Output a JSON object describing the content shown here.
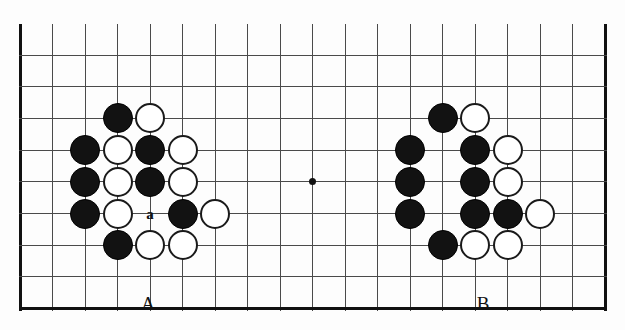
{
  "figure": {
    "type": "go-board-diagram",
    "width": 625,
    "height": 330,
    "background_color": "#fdfdfd",
    "line_color": "#4a4a4a",
    "edge_color": "#111111",
    "black_stone_color": "#121212",
    "white_stone_color": "#ffffff"
  },
  "board": {
    "columns": 19,
    "rows": 9,
    "origin_x": 20,
    "origin_y": 55,
    "col_spacing": 32.5,
    "row_spacing": 31.7,
    "stone_diameter": 30,
    "top_edge_y": 24,
    "vertical_line_top": 24,
    "edges": {
      "left": true,
      "right": true,
      "bottom": true,
      "top": false
    },
    "star_points": [
      {
        "col": 9,
        "row": 4
      }
    ]
  },
  "stones": [
    {
      "color": "black",
      "col": 3,
      "row": 2,
      "group": "A"
    },
    {
      "color": "white",
      "col": 4,
      "row": 2,
      "group": "A"
    },
    {
      "color": "black",
      "col": 2,
      "row": 3,
      "group": "A"
    },
    {
      "color": "white",
      "col": 3,
      "row": 3,
      "group": "A"
    },
    {
      "color": "black",
      "col": 4,
      "row": 3,
      "group": "A"
    },
    {
      "color": "white",
      "col": 5,
      "row": 3,
      "group": "A"
    },
    {
      "color": "black",
      "col": 2,
      "row": 4,
      "group": "A"
    },
    {
      "color": "white",
      "col": 3,
      "row": 4,
      "group": "A"
    },
    {
      "color": "black",
      "col": 4,
      "row": 4,
      "group": "A"
    },
    {
      "color": "white",
      "col": 5,
      "row": 4,
      "group": "A"
    },
    {
      "color": "black",
      "col": 2,
      "row": 5,
      "group": "A"
    },
    {
      "color": "white",
      "col": 3,
      "row": 5,
      "group": "A"
    },
    {
      "color": "black",
      "col": 5,
      "row": 5,
      "group": "A"
    },
    {
      "color": "white",
      "col": 6,
      "row": 5,
      "group": "A"
    },
    {
      "color": "black",
      "col": 3,
      "row": 6,
      "group": "A"
    },
    {
      "color": "white",
      "col": 4,
      "row": 6,
      "group": "A"
    },
    {
      "color": "white",
      "col": 5,
      "row": 6,
      "group": "A"
    },
    {
      "color": "black",
      "col": 13,
      "row": 2,
      "group": "B"
    },
    {
      "color": "white",
      "col": 14,
      "row": 2,
      "group": "B"
    },
    {
      "color": "black",
      "col": 12,
      "row": 3,
      "group": "B"
    },
    {
      "color": "black",
      "col": 14,
      "row": 3,
      "group": "B"
    },
    {
      "color": "white",
      "col": 15,
      "row": 3,
      "group": "B"
    },
    {
      "color": "black",
      "col": 12,
      "row": 4,
      "group": "B"
    },
    {
      "color": "black",
      "col": 14,
      "row": 4,
      "group": "B"
    },
    {
      "color": "white",
      "col": 15,
      "row": 4,
      "group": "B"
    },
    {
      "color": "black",
      "col": 12,
      "row": 5,
      "group": "B"
    },
    {
      "color": "black",
      "col": 14,
      "row": 5,
      "group": "B"
    },
    {
      "color": "black",
      "col": 15,
      "row": 5,
      "group": "B"
    },
    {
      "color": "white",
      "col": 16,
      "row": 5,
      "group": "B"
    },
    {
      "color": "black",
      "col": 13,
      "row": 6,
      "group": "B"
    },
    {
      "color": "white",
      "col": 14,
      "row": 6,
      "group": "B"
    },
    {
      "color": "white",
      "col": 15,
      "row": 6,
      "group": "B"
    }
  ],
  "point_labels": [
    {
      "text": "a",
      "col": 4,
      "row": 5
    }
  ],
  "captions": [
    {
      "text": "A",
      "x": 148,
      "y": 293
    },
    {
      "text": "B",
      "x": 483,
      "y": 293
    }
  ]
}
